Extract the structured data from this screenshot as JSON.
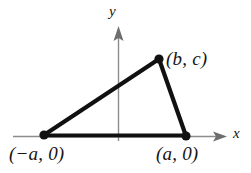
{
  "figure": {
    "background_color": "#ffffff",
    "axes": {
      "color": "#8c8c8c",
      "x_axis": {
        "label": "x",
        "label_icon": "x-axis-label",
        "arrow": "arrow-right-icon"
      },
      "y_axis": {
        "label": "y",
        "label_icon": "y-axis-label",
        "arrow": "arrow-up-icon"
      }
    },
    "shape": {
      "type": "triangle",
      "stroke_color": "#111111",
      "stroke_width": 4,
      "vertex_marker": "filled-dot",
      "vertices": [
        {
          "name": "left-vertex",
          "label": "(−a, 0)",
          "x": 44,
          "y": 135
        },
        {
          "name": "apex-vertex",
          "label": "(b, c)",
          "x": 159,
          "y": 59
        },
        {
          "name": "right-vertex",
          "label": "(a, 0)",
          "x": 186,
          "y": 136
        }
      ]
    },
    "labels": {
      "y_axis": "y",
      "x_axis": "x",
      "apex": "(b, c)",
      "left_point": "(−a, 0)",
      "right_point": "(a, 0)"
    }
  }
}
